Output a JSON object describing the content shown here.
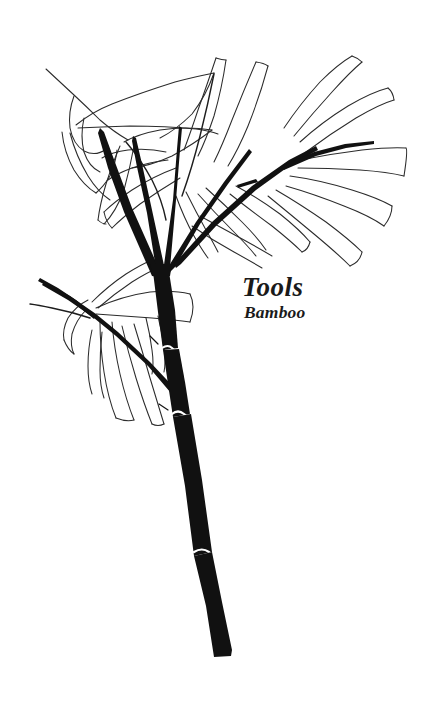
{
  "page": {
    "background_color": "#ffffff",
    "width": 432,
    "height": 715
  },
  "artwork": {
    "subject": "bamboo-branch-line-drawing",
    "style": "black-and-white pen line art botanical illustration",
    "ink_color": "#111111",
    "outline_color": "#2b2b2b",
    "node_ring_color": "#ffffff"
  },
  "caption": {
    "title": "Tools",
    "subtitle": "Bamboo"
  }
}
